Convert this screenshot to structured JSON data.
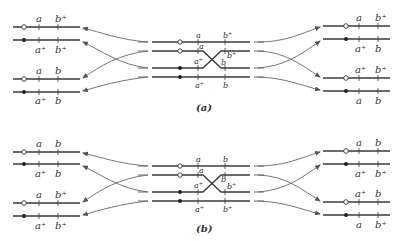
{
  "figure": {
    "panel_a": {
      "caption": "(a)",
      "left": {
        "pair1": {
          "top": [
            "a",
            "b⁺"
          ],
          "bottom": [
            "a⁺",
            "b⁺"
          ]
        },
        "pair2": {
          "top": [
            "a",
            "b"
          ],
          "bottom": [
            "a⁺",
            "b"
          ]
        }
      },
      "center": {
        "labels": [
          "a",
          "b⁺",
          "a",
          "b⁺",
          "a⁺",
          "b",
          "a⁺",
          "b"
        ]
      },
      "right": {
        "pair1": {
          "top": [
            "a",
            "b⁺"
          ],
          "bottom": [
            "a⁺",
            "b"
          ]
        },
        "pair2": {
          "top": [
            "a⁺",
            "b⁺"
          ],
          "bottom": [
            "a",
            "b"
          ]
        }
      }
    },
    "panel_b": {
      "caption": "(b)",
      "left": {
        "pair1": {
          "top": [
            "a",
            "b"
          ],
          "bottom": [
            "a⁺",
            "b"
          ]
        },
        "pair2": {
          "top": [
            "a",
            "b⁺"
          ],
          "bottom": [
            "a⁺",
            "b⁺"
          ]
        }
      },
      "center": {
        "labels": [
          "a",
          "b",
          "a",
          "b",
          "a⁺",
          "b⁺",
          "a⁺",
          "b⁺"
        ]
      },
      "right": {
        "pair1": {
          "top": [
            "a",
            "b"
          ],
          "bottom": [
            "a⁺",
            "b⁺"
          ]
        },
        "pair2": {
          "top": [
            "a⁺",
            "b"
          ],
          "bottom": [
            "a",
            "b⁺"
          ]
        }
      }
    },
    "colors": {
      "line": "#3a3a3a",
      "arrow": "#666666",
      "background": "#ffffff"
    }
  }
}
